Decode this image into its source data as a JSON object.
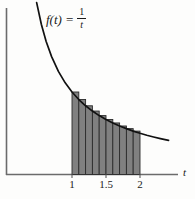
{
  "figure": {
    "name": "riemann-sum-upper-rectangles",
    "background_color": "#fdfdfc"
  },
  "function_label": {
    "prefix": "f(t)",
    "equals": "=",
    "numerator": "1",
    "denominator": "t"
  },
  "axes": {
    "x_axis_label": "t",
    "y_axis_label": "",
    "x_ticks": [
      {
        "label": "1",
        "value": 1
      },
      {
        "label": "1.5",
        "value": 1.5
      },
      {
        "label": "2",
        "value": 2
      }
    ]
  },
  "chart_data": {
    "type": "area",
    "title": "",
    "xlabel": "t",
    "ylabel": "",
    "function": "f(t) = 1/t",
    "grid": false,
    "legend_position": "none",
    "xlim": [
      0.45,
      2.45
    ],
    "ylim": [
      0,
      2.2
    ],
    "curve": {
      "name": "f(t) = 1/t",
      "color": "#111111",
      "x": [
        0.48,
        0.55,
        0.62,
        0.7,
        0.8,
        0.9,
        1.0,
        1.1,
        1.2,
        1.3,
        1.4,
        1.5,
        1.6,
        1.7,
        1.8,
        1.9,
        2.0,
        2.1,
        2.2,
        2.3,
        2.42
      ],
      "y": [
        2.083,
        1.818,
        1.613,
        1.429,
        1.25,
        1.111,
        1.0,
        0.909,
        0.833,
        0.769,
        0.714,
        0.667,
        0.625,
        0.588,
        0.556,
        0.526,
        0.5,
        0.476,
        0.455,
        0.435,
        0.413
      ]
    },
    "rectangles": {
      "name": "left-endpoint upper sum rectangles",
      "count": 10,
      "interval": [
        1,
        2
      ],
      "width": 0.1,
      "fill_color": "#808080",
      "edge_color": "#2b2b2b",
      "left_edges": [
        1.0,
        1.1,
        1.2,
        1.3,
        1.4,
        1.5,
        1.6,
        1.7,
        1.8,
        1.9
      ],
      "heights": [
        1.0,
        0.909,
        0.833,
        0.769,
        0.714,
        0.667,
        0.625,
        0.588,
        0.556,
        0.526
      ]
    }
  },
  "colors": {
    "curve": "#111111",
    "axis": "#6b6b6b",
    "bar_fill": "#808080",
    "bar_edge": "#2b2b2b",
    "text": "#1a1a1a"
  }
}
